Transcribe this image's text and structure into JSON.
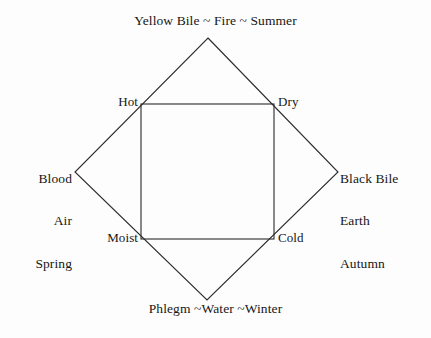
{
  "figure": {
    "name": "four-humours-diagram",
    "background_color": "#fdfdfd",
    "line_color": "#2b2b2b",
    "text_color": "#171717"
  },
  "humours": {
    "top": {
      "text": "Yellow Bile ~ Fire ~ Summer",
      "humour": "Yellow Bile",
      "element": "Fire",
      "season": "Summer"
    },
    "bottom": {
      "text": "Phlegm ~Water ~Winter",
      "humour": "Phlegm",
      "element": "Water",
      "season": "Winter"
    },
    "left": {
      "humour": "Blood",
      "element": "Air",
      "season": "Spring"
    },
    "right": {
      "humour": "Black Bile",
      "element": "Earth",
      "season": "Autumn"
    }
  },
  "qualities": {
    "hot": "Hot",
    "dry": "Dry",
    "moist": "Moist",
    "cold": "Cold"
  },
  "geometry": {
    "diamond": {
      "top": [
        208,
        38
      ],
      "right": [
        338,
        172
      ],
      "bottom": [
        207,
        300
      ],
      "left": [
        75,
        172
      ]
    },
    "square": {
      "left": 141,
      "top": 104,
      "right": 274,
      "bottom": 239
    }
  }
}
